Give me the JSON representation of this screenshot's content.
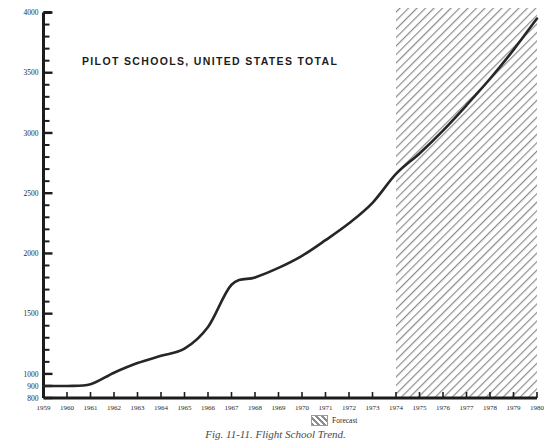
{
  "figure": {
    "title": "PILOT SCHOOLS, UNITED STATES TOTAL",
    "caption": "Fig. 11-11.  Flight School Trend.",
    "legend_label": "Forecast"
  },
  "chart_data": {
    "type": "line",
    "title": "PILOT SCHOOLS, UNITED STATES TOTAL",
    "xlabel": "",
    "ylabel": "",
    "xlim": [
      1959,
      1980
    ],
    "ylim": [
      800,
      4000
    ],
    "grid": false,
    "legend_position": "below-right",
    "x": [
      1959,
      1960,
      1961,
      1962,
      1963,
      1964,
      1965,
      1966,
      1967,
      1968,
      1969,
      1970,
      1971,
      1972,
      1973,
      1974,
      1975,
      1976,
      1977,
      1978,
      1979,
      1980
    ],
    "series": [
      {
        "name": "Pilot schools, United States total",
        "values": [
          900,
          900,
          915,
          1010,
          1090,
          1150,
          1210,
          1390,
          1740,
          1800,
          1880,
          1980,
          2110,
          2250,
          2420,
          2660,
          2830,
          3020,
          3230,
          3450,
          3690,
          3950
        ]
      }
    ],
    "yticks_major": [
      800,
      900,
      1000,
      1500,
      2000,
      2500,
      3000,
      3500,
      4000
    ],
    "yticks_minor_step": 100,
    "xticks": [
      1959,
      1960,
      1961,
      1962,
      1963,
      1964,
      1965,
      1966,
      1967,
      1968,
      1969,
      1970,
      1971,
      1972,
      1973,
      1974,
      1975,
      1976,
      1977,
      1978,
      1979,
      1980
    ],
    "annotations": [
      {
        "label": "Forecast",
        "type": "hatched-region",
        "x_start": 1974,
        "x_end": 1980
      }
    ],
    "axis_color": "#1c1c1c",
    "line_color": "#262626",
    "hatch_color": "#8c8c8c"
  },
  "ytick_labels": [
    "4000",
    "3500",
    "3000",
    "2500",
    "2000",
    "1500",
    "1000",
    "900",
    "800"
  ],
  "xtick_labels": [
    "1959",
    "1960",
    "1961",
    "1962",
    "1963",
    "1964",
    "1965",
    "1966",
    "1967",
    "1968",
    "1969",
    "1970",
    "1971",
    "1972",
    "1973",
    "1974",
    "1975",
    "1976",
    "1977",
    "1978",
    "1979",
    "1980"
  ]
}
